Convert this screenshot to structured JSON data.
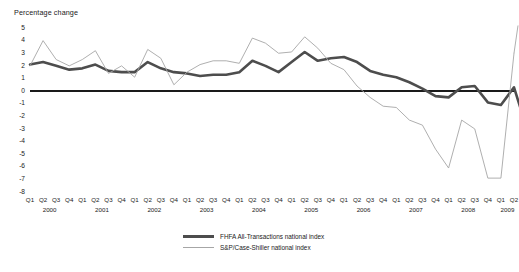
{
  "axis_title": "Percentage change",
  "legend": [
    {
      "style": "thick",
      "label": "FHFA All-Transactions national index"
    },
    {
      "style": "thin",
      "label": "S&P/Case-Shiller national index"
    }
  ],
  "chart_data": {
    "type": "line",
    "title": "",
    "subtitle": "",
    "xlabel": "",
    "ylabel": "Percentage change",
    "ylim": [
      -8,
      5
    ],
    "ytick_values": [
      5,
      4,
      3,
      2,
      1,
      0,
      -1,
      -2,
      -3,
      -4,
      -5,
      -6,
      -7,
      -8
    ],
    "ytick_labels": [
      "5",
      "4",
      "3",
      "2",
      "1",
      "0",
      "-1",
      "-2",
      "-3",
      "-4",
      "-5",
      "-6",
      "-7",
      "-8"
    ],
    "grid": false,
    "zero_line": true,
    "legend_position": "bottom-center",
    "x": [
      "2000 Q1",
      "2000 Q2",
      "2000 Q3",
      "2000 Q4",
      "2001 Q1",
      "2001 Q2",
      "2001 Q3",
      "2001 Q4",
      "2002 Q1",
      "2002 Q2",
      "2002 Q3",
      "2002 Q4",
      "2003 Q1",
      "2003 Q2",
      "2003 Q3",
      "2003 Q4",
      "2004 Q1",
      "2004 Q2",
      "2004 Q3",
      "2004 Q4",
      "2005 Q1",
      "2005 Q2",
      "2005 Q3",
      "2005 Q4",
      "2006 Q1",
      "2006 Q2",
      "2006 Q3",
      "2006 Q4",
      "2007 Q1",
      "2007 Q2",
      "2007 Q3",
      "2007 Q4",
      "2008 Q1",
      "2008 Q2",
      "2008 Q3",
      "2008 Q4",
      "2009 Q1",
      "2009 Q2"
    ],
    "xtick_labels": [
      "Q1",
      "Q2",
      "Q3",
      "Q4",
      "Q1",
      "Q2",
      "Q3",
      "Q4",
      "Q1",
      "Q2",
      "Q3",
      "Q4",
      "Q1",
      "Q2",
      "Q3",
      "Q4",
      "Q1",
      "Q2",
      "Q3",
      "Q4",
      "Q1",
      "Q2",
      "Q3",
      "Q4",
      "Q1",
      "Q2",
      "Q3",
      "Q4",
      "Q1",
      "Q2",
      "Q3",
      "Q4",
      "Q1",
      "Q2",
      "Q3",
      "Q4",
      "Q1",
      "Q2"
    ],
    "year_labels": [
      "2000",
      "2001",
      "2002",
      "2003",
      "2004",
      "2005",
      "2006",
      "2007",
      "2008",
      "2009"
    ],
    "year_tick_indices": [
      1.5,
      5.5,
      9.5,
      13.5,
      17.5,
      21.5,
      25.5,
      29.5,
      33.5,
      36.5
    ],
    "series": [
      {
        "name": "FHFA All-Transactions national index",
        "color": "#4d4d4d",
        "width": 2.6,
        "values": [
          2.1,
          2.3,
          2.0,
          1.7,
          1.8,
          2.1,
          1.6,
          1.5,
          1.5,
          2.3,
          1.8,
          1.5,
          1.4,
          1.2,
          1.3,
          1.3,
          1.5,
          2.4,
          2.0,
          1.5,
          2.3,
          3.1,
          2.4,
          2.6,
          2.7,
          2.3,
          1.6,
          1.3,
          1.1,
          0.7,
          0.2,
          -0.4,
          -0.5,
          0.3,
          0.4,
          -0.9,
          -1.1,
          0.3
        ],
        "end_value": -2.0
      },
      {
        "name": "S&P/Case-Shiller national index",
        "color": "#a6a6a6",
        "width": 0.9,
        "values": [
          2.0,
          4.0,
          2.5,
          2.0,
          2.5,
          3.2,
          1.4,
          2.0,
          1.1,
          3.3,
          2.6,
          0.5,
          1.5,
          2.1,
          2.4,
          2.4,
          2.2,
          4.2,
          3.8,
          3.0,
          3.1,
          4.3,
          3.4,
          2.2,
          1.7,
          0.4,
          -0.5,
          -1.2,
          -1.3,
          -2.3,
          -2.7,
          -4.6,
          -6.1,
          -2.3,
          -3.0,
          -6.9,
          -6.9,
          3.0
        ]
      }
    ]
  }
}
